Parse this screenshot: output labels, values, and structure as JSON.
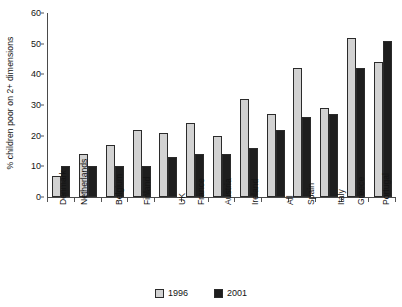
{
  "chart_data": {
    "type": "bar",
    "title": "",
    "subtitle": "",
    "xlabel": "",
    "ylabel": "% children poor on 2+ dimensions",
    "ylim": [
      0,
      60
    ],
    "yticks": [
      0,
      10,
      20,
      30,
      40,
      50,
      60
    ],
    "grid": false,
    "legend_position": "bottom-center",
    "categories": [
      "Denmark",
      "Netherlands",
      "Belgium",
      "Finland",
      "UK",
      "France",
      "Austria",
      "Ireland",
      "All",
      "Spain",
      "Italy",
      "Greece",
      "Portugal"
    ],
    "series": [
      {
        "name": "1996",
        "color": "#d2d2d2",
        "values": [
          7,
          14,
          17,
          22,
          21,
          24,
          20,
          32,
          27,
          42,
          29,
          52,
          44
        ]
      },
      {
        "name": "2001",
        "color": "#1e1e1e",
        "values": [
          10,
          10,
          10,
          10,
          13,
          14,
          14,
          16,
          22,
          26,
          27,
          42,
          51
        ]
      }
    ]
  }
}
